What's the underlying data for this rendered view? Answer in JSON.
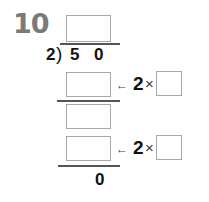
{
  "problem": {
    "number": "10",
    "divisor": "2",
    "dividend_digits": [
      "5",
      "0"
    ],
    "quotient_box": "",
    "steps": [
      {
        "product_box": "",
        "arrow": "←",
        "multiplier": "2",
        "times": "×",
        "factor_box": ""
      },
      {
        "remainder_box": ""
      },
      {
        "product_box": "",
        "arrow": "←",
        "multiplier": "2",
        "times": "×",
        "factor_box": ""
      }
    ],
    "final_remainder": "0"
  }
}
